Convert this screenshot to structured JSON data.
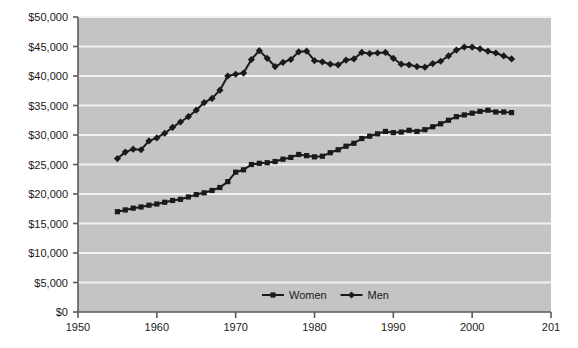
{
  "chart_data": {
    "type": "line",
    "title": "",
    "subtitle": "",
    "xlabel": "",
    "ylabel": "",
    "xlim": [
      1950,
      2010
    ],
    "ylim": [
      0,
      50000
    ],
    "grid": true,
    "grid_axis": "y",
    "legend_position": "bottom-center",
    "plot_background_color": "#c4c4c4",
    "gridline_color": "#f2f2f2",
    "axis_color": "#5a5a5a",
    "series_color": "#1a1a1a",
    "x_tick_labels": [
      "1950",
      "1960",
      "1970",
      "1980",
      "1990",
      "2000",
      "201"
    ],
    "x_tick_values": [
      1950,
      1960,
      1970,
      1980,
      1990,
      2000,
      2010
    ],
    "y_tick_labels": [
      "$0",
      "$5,000",
      "$10,000",
      "$15,000",
      "$20,000",
      "$25,000",
      "$30,000",
      "$35,000",
      "$40,000",
      "$45,000",
      "$50,000"
    ],
    "y_tick_values": [
      0,
      5000,
      10000,
      15000,
      20000,
      25000,
      30000,
      35000,
      40000,
      45000,
      50000
    ],
    "x": [
      1955,
      1956,
      1957,
      1958,
      1959,
      1960,
      1961,
      1962,
      1963,
      1964,
      1965,
      1966,
      1967,
      1968,
      1969,
      1970,
      1971,
      1972,
      1973,
      1974,
      1975,
      1976,
      1977,
      1978,
      1979,
      1980,
      1981,
      1982,
      1983,
      1984,
      1985,
      1986,
      1987,
      1988,
      1989,
      1990,
      1991,
      1992,
      1993,
      1994,
      1995,
      1996,
      1997,
      1998,
      1999,
      2000,
      2001,
      2002,
      2003,
      2004,
      2005
    ],
    "series": [
      {
        "name": "Women",
        "marker": "square",
        "color": "#1a1a1a",
        "values": [
          17000,
          17300,
          17600,
          17800,
          18100,
          18300,
          18600,
          18900,
          19100,
          19500,
          19900,
          20200,
          20600,
          21100,
          22100,
          23700,
          24100,
          25000,
          25200,
          25300,
          25500,
          25900,
          26200,
          26700,
          26500,
          26300,
          26400,
          27000,
          27500,
          28100,
          28600,
          29400,
          29800,
          30200,
          30600,
          30400,
          30500,
          30800,
          30600,
          30900,
          31400,
          31900,
          32500,
          33100,
          33400,
          33700,
          34000,
          34200,
          33900,
          33900,
          33800
        ]
      },
      {
        "name": "Men",
        "marker": "diamond",
        "color": "#1a1a1a",
        "values": [
          26000,
          27100,
          27600,
          27500,
          29000,
          29500,
          30300,
          31300,
          32200,
          33100,
          34200,
          35500,
          36200,
          37600,
          40000,
          40300,
          40500,
          42800,
          44300,
          43000,
          41600,
          42300,
          42800,
          44100,
          44200,
          42600,
          42400,
          42000,
          41900,
          42700,
          42900,
          44000,
          43800,
          43900,
          44000,
          43000,
          42000,
          41900,
          41600,
          41500,
          42100,
          42500,
          43400,
          44400,
          44900,
          44900,
          44600,
          44200,
          43900,
          43400,
          42900
        ]
      }
    ]
  }
}
